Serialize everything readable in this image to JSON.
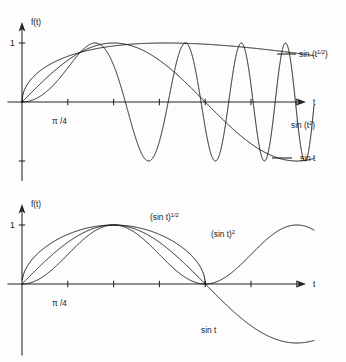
{
  "figure": {
    "background": "#fdfdfd",
    "ink": "#101010",
    "width": 346,
    "height": 362
  },
  "chart_data": [
    {
      "id": "top",
      "type": "line",
      "title": "",
      "xlabel": "t",
      "ylabel": "f(t)",
      "xlim": [
        0,
        22
      ],
      "ylim": [
        -1.35,
        1.25
      ],
      "grid": false,
      "legend_position": "inline-right",
      "x_tick_labels": [
        "π /4"
      ],
      "x_tick_label_values": [
        0.785
      ],
      "x_tick_values": [
        0.785,
        1.571,
        2.356,
        3.142,
        3.927,
        4.712
      ],
      "y_tick_labels": [
        "1"
      ],
      "y_tick_values": [
        1,
        -1
      ],
      "series": [
        {
          "name": "sin (t¹ᶠ²)",
          "label_html": "sin (t<sup>1/2</sup>)",
          "expr": "sin_sqrt",
          "label_x": 310,
          "label_y": 57,
          "leader": [
            [
              277,
              54
            ],
            [
              296,
              54
            ]
          ]
        },
        {
          "name": "sin t",
          "label_html": "sin t",
          "expr": "sin",
          "label_x": 300,
          "label_y": 161,
          "leader": [
            [
              272,
              158
            ],
            [
              292,
              158
            ]
          ]
        },
        {
          "name": "sin (t²)",
          "label_html": "sin (t<sup>2</sup>)",
          "expr": "sin_sq_arg",
          "label_x": 300,
          "label_y": 126,
          "leader": []
        }
      ],
      "notes": "sin(t^1/2) rises fast and stays near 1; sin(t) is one slow period; sin(t^2) oscillates with increasing frequency"
    },
    {
      "id": "bottom",
      "type": "line",
      "title": "",
      "xlabel": "t",
      "ylabel": "f(t)",
      "xlim": [
        0,
        9.4
      ],
      "ylim": [
        -1.35,
        1.25
      ],
      "grid": false,
      "legend_position": "inline",
      "x_tick_labels": [
        "π /4"
      ],
      "x_tick_label_values": [
        0.785
      ],
      "x_tick_values": [
        0.785,
        1.571,
        2.356,
        3.142,
        3.927,
        4.712
      ],
      "y_tick_labels": [
        "1"
      ],
      "y_tick_values": [
        1
      ],
      "series": [
        {
          "name": "(sin t)^1/2",
          "label_html": "(sin t)<sup>1/2</sup>",
          "expr": "sqrt_sin",
          "label_x": 150,
          "label_y": 220,
          "leader": []
        },
        {
          "name": "(sin t)^2",
          "label_html": "(sin t)<sup>2</sup>",
          "expr": "sin_squared",
          "label_x": 211,
          "label_y": 237,
          "leader": []
        },
        {
          "name": "sin t",
          "label_html": "sin t",
          "expr": "sin",
          "label_x": 201,
          "label_y": 333,
          "leader": []
        }
      ],
      "notes": "one arch of sin t with its square and square root; beyond pi the square rises again while sin t goes negative"
    }
  ],
  "labels": {
    "y_axis": "f(t)",
    "x_axis": "t",
    "one": "1",
    "pi_over_4": "π /4",
    "top": {
      "sin_sqrt_base": "sin (t",
      "sin_sqrt_sup": "1/2",
      "sin_sqrt_close": ")",
      "sin_sq_base": "sin (t",
      "sin_sq_sup": "2",
      "sin_sq_close": ")",
      "sin_t": "sin t"
    },
    "bottom": {
      "sqrt_base": "(sin t)",
      "sqrt_sup": "1/2",
      "sq_base": "(sin t)",
      "sq_sup": "2",
      "sin_t": "sin t"
    }
  }
}
